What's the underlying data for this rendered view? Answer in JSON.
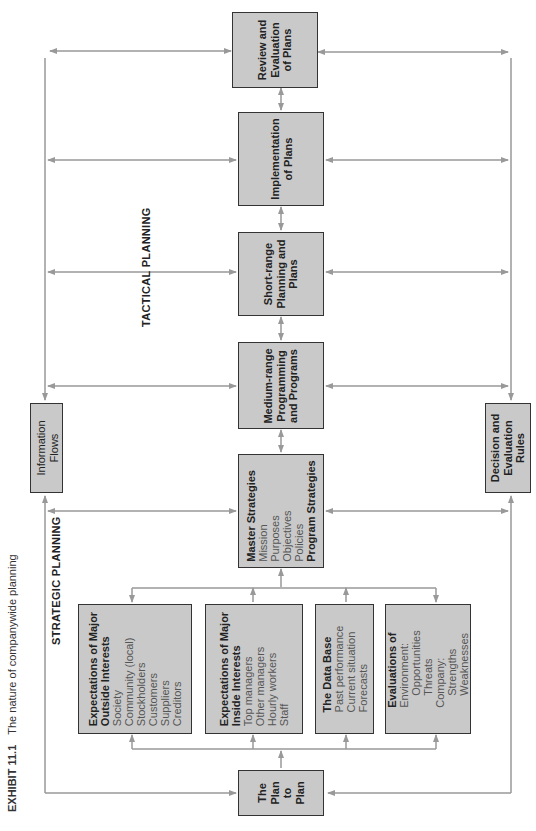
{
  "caption": {
    "exhibit": "EXHIBIT 11.1",
    "title": "The nature of companywide planning"
  },
  "labels": {
    "strategic": "STRATEGIC PLANNING",
    "tactical": "TACTICAL PLANNING"
  },
  "boxes": {
    "review": [
      "Review and",
      "Evaluation",
      "of Plans"
    ],
    "implementation": [
      "Implementation",
      "of Plans"
    ],
    "short_range": [
      "Short-range",
      "Planning and",
      "Plans"
    ],
    "medium_range": [
      "Medium-range",
      "Programming",
      "and Programs"
    ],
    "master": {
      "heading": "Master Strategies",
      "items": [
        "Mission",
        "Purposes",
        "Objectives",
        "Policies"
      ],
      "footer": "Program Strategies"
    },
    "outside": {
      "heading": [
        "Expectations of Major",
        "Outside Interests"
      ],
      "items": [
        "Society",
        "Community (local)",
        "Stockholders",
        "Customers",
        "Suppliers",
        "Creditors"
      ]
    },
    "inside": {
      "heading": [
        "Expectations of Major",
        "Inside Interests"
      ],
      "items": [
        "Top managers",
        "Other managers",
        "Hourly workers",
        "Staff"
      ]
    },
    "database": {
      "heading": "The Data Base",
      "items": [
        "Past performance",
        "Current situation",
        "Forecasts"
      ]
    },
    "evaluations": {
      "heading": "Evaluations of",
      "items": [
        "Environment:",
        "Opportunities",
        "Threats",
        "Company:",
        "Strengths",
        "Weaknesses"
      ]
    },
    "plan_to_plan": [
      "The",
      "Plan",
      "to",
      "Plan"
    ],
    "info_flows": [
      "Information",
      "Flows"
    ],
    "decision_rules": [
      "Decision and",
      "Evaluation",
      "Rules"
    ]
  },
  "colors": {
    "box_fill": "#c9c9c9",
    "box_border": "#333333",
    "line": "#999999"
  }
}
